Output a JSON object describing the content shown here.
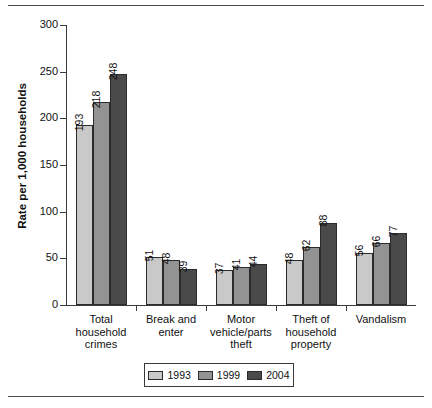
{
  "chart_data": {
    "type": "bar",
    "title": "",
    "xlabel": "",
    "ylabel": "Rate per 1,000 households",
    "ylim": [
      0,
      300
    ],
    "yticks": [
      0,
      50,
      100,
      150,
      200,
      250,
      300
    ],
    "grid": false,
    "legend_position": "bottom",
    "categories": [
      "Total household crimes",
      "Break and enter",
      "Motor vehicle/parts theft",
      "Theft of household property",
      "Vandalism"
    ],
    "category_lines": [
      [
        "Total",
        "household",
        "crimes"
      ],
      [
        "Break and",
        "enter"
      ],
      [
        "Motor",
        "vehicle/parts",
        "theft"
      ],
      [
        "Theft of",
        "household",
        "property"
      ],
      [
        "Vandalism"
      ]
    ],
    "series": [
      {
        "name": "1993",
        "color": "#c9c9c9",
        "values": [
          193,
          51,
          37,
          48,
          56
        ]
      },
      {
        "name": "1999",
        "color": "#939393",
        "values": [
          218,
          48,
          41,
          62,
          66
        ]
      },
      {
        "name": "2004",
        "color": "#4a4a4a",
        "values": [
          248,
          39,
          44,
          88,
          77
        ]
      }
    ]
  },
  "legend": {
    "items": [
      {
        "label": "1993",
        "color": "#c9c9c9"
      },
      {
        "label": "1999",
        "color": "#939393"
      },
      {
        "label": "2004",
        "color": "#4a4a4a"
      }
    ]
  }
}
